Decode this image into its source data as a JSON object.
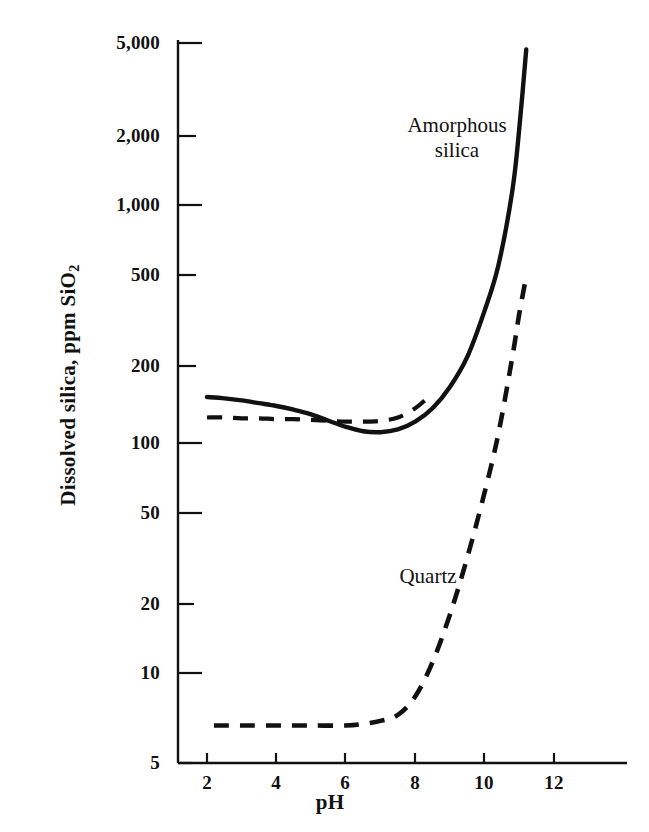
{
  "chart_data": {
    "type": "line",
    "title": "",
    "xlabel": "pH",
    "ylabel": "Dissolved silica, ppm SiO",
    "ylabel_sub": "2",
    "yscale": "log",
    "xscale": "linear",
    "xlim": [
      1.2,
      13.6
    ],
    "ylim": [
      5,
      5800
    ],
    "grid": false,
    "legend": "inline-annotations",
    "xticks": [
      2,
      4,
      6,
      8,
      10,
      12
    ],
    "xtick_labels": [
      "2",
      "4",
      "6",
      "8",
      "10",
      "12"
    ],
    "yticks": [
      5,
      10,
      20,
      50,
      100,
      200,
      500,
      1000,
      2000,
      5000
    ],
    "ytick_labels": [
      "5",
      "10",
      "20",
      "50",
      "100",
      "200",
      "500",
      "1,000",
      "2,000",
      "5,000"
    ],
    "series": [
      {
        "name": "Amorphous silica",
        "style": "solid",
        "annotation": "Amorphous\nsilica",
        "x": [
          2.0,
          2.5,
          3.0,
          3.5,
          4.0,
          4.5,
          5.0,
          5.5,
          6.0,
          6.5,
          7.0,
          7.5,
          8.0,
          8.5,
          9.0,
          9.5,
          10.0,
          10.4,
          10.8,
          11.0,
          11.2
        ],
        "values": [
          156,
          154,
          151,
          147,
          143,
          138,
          132,
          124,
          117,
          112,
          111,
          114,
          123,
          140,
          172,
          230,
          360,
          560,
          1150,
          2100,
          4500
        ]
      },
      {
        "name": "Amorphous silica (dashed segment)",
        "style": "dashed",
        "annotation": "",
        "x": [
          2.0,
          2.5,
          3.0,
          3.5,
          4.0,
          4.5,
          5.0,
          5.5,
          6.0,
          6.5,
          7.0,
          7.5,
          8.0,
          8.3
        ],
        "values": [
          128,
          128,
          127,
          127,
          126,
          126,
          125,
          124,
          123,
          123,
          124,
          128,
          140,
          152
        ]
      },
      {
        "name": "Quartz",
        "style": "dashed",
        "annotation": "Quartz",
        "x": [
          2.2,
          3.0,
          4.0,
          5.0,
          6.0,
          6.5,
          7.0,
          7.5,
          8.0,
          8.5,
          9.0,
          9.5,
          10.0,
          10.4,
          10.8,
          11.0,
          11.2
        ],
        "values": [
          6.5,
          6.5,
          6.5,
          6.5,
          6.5,
          6.6,
          6.8,
          7.2,
          8.6,
          12.0,
          19.0,
          33.0,
          62.0,
          110,
          230,
          350,
          500
        ]
      }
    ]
  },
  "axes": {
    "x_label": "pH",
    "y_label_main": "Dissolved silica, ppm SiO",
    "y_label_subscript": "2"
  },
  "colors": {
    "ink": "#111111",
    "background": "#ffffff"
  }
}
